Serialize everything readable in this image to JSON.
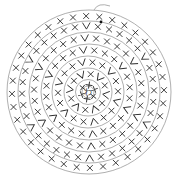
{
  "diagram": {
    "type": "crochet-round-chart",
    "center_label": "わ",
    "center": {
      "x": 88,
      "y": 92
    },
    "colors": {
      "ring": "#9a9a9a",
      "stitch": "#2a2a2a",
      "background": "#ffffff"
    },
    "rounds": [
      {
        "round": 1,
        "radius": 7,
        "stitch_count": 6,
        "pattern": [
          "plus"
        ]
      },
      {
        "round": 2,
        "radius": 18,
        "stitch_count": 12,
        "pattern": [
          "x",
          "v"
        ]
      },
      {
        "round": 3,
        "radius": 30,
        "stitch_count": 18,
        "pattern": [
          "x",
          "x",
          "v"
        ]
      },
      {
        "round": 4,
        "radius": 42,
        "stitch_count": 24,
        "pattern": [
          "x",
          "x",
          "x",
          "v"
        ]
      },
      {
        "round": 5,
        "radius": 54,
        "stitch_count": 30,
        "pattern": [
          "x",
          "x",
          "x",
          "x",
          "v"
        ]
      },
      {
        "round": 6,
        "radius": 66,
        "stitch_count": 36,
        "pattern": [
          "x",
          "x",
          "x",
          "x",
          "x",
          "v"
        ]
      },
      {
        "round": 7,
        "radius": 76,
        "stitch_count": 36,
        "pattern": [
          "x"
        ]
      }
    ],
    "end_marker": {
      "x": 101,
      "y": 22,
      "symbol": "dot"
    },
    "legend": {
      "plus": "single crochet (round 1)",
      "x": "single crochet",
      "v": "increase"
    }
  }
}
